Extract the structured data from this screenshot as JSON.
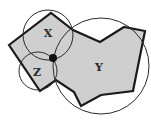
{
  "diagram": {
    "type": "polygon-with-covering-circles",
    "colors": {
      "polygon_fill": "#cfcfcf",
      "polygon_stroke": "#1a1a1a",
      "circle_stroke": "#2a2a2a",
      "junction_dot": "#111111"
    },
    "regions": [
      {
        "id": "x",
        "label": "X"
      },
      {
        "id": "y",
        "label": "Y"
      },
      {
        "id": "z",
        "label": "Z"
      }
    ],
    "polygon_points": "9,45 51,13 73,30 100,42 124,27 145,31 133,91 101,95 81,106 74,92 56,80 40,91",
    "circles": [
      {
        "id": "x",
        "cx": 48,
        "cy": 35,
        "r": 25
      },
      {
        "id": "z",
        "cx": 38,
        "cy": 71,
        "r": 19
      },
      {
        "id": "y",
        "cx": 101,
        "cy": 66,
        "r": 48
      }
    ],
    "junction": {
      "cx": 53,
      "cy": 58,
      "r": 4
    }
  }
}
